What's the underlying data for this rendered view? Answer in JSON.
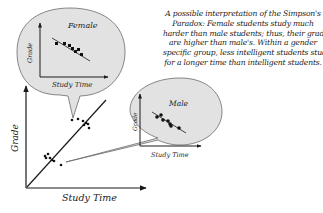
{
  "caption": {
    "lines": [
      "A possible interpretation of the Simpson's",
      "Paradox: Female students study much",
      "harder than male students; thus, their grades",
      "are higher than male's. Within a gender",
      "specific group, less intelligent students study",
      "for a longer time than intelligent students."
    ]
  },
  "main_plot": {
    "xlabel": "Study Time",
    "ylabel": "Grade"
  },
  "female_bubble": {
    "title": "Female",
    "xlabel": "Study Time",
    "ylabel": "Grade"
  },
  "male_bubble": {
    "title": "Male",
    "xlabel": "Study Time",
    "ylabel": "Grade"
  },
  "colors": {
    "bubble_fill": "#e2e2e2",
    "ink": "#1a1a1a",
    "background": "#ffffff"
  }
}
